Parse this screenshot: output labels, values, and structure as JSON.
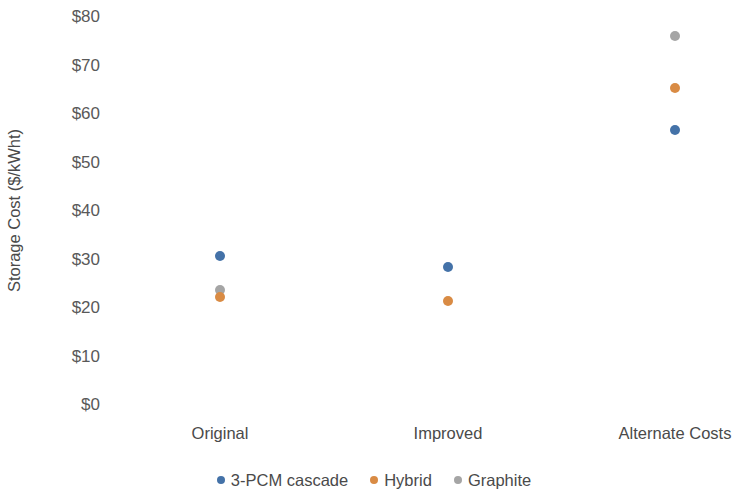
{
  "chart_data": {
    "type": "scatter",
    "title": "",
    "xlabel": "",
    "ylabel": "Storage Cost ($/kWht)",
    "categories": [
      "Original",
      "Improved",
      "Alternate Costs"
    ],
    "ylim": [
      0,
      80
    ],
    "ytick_values": [
      0,
      10,
      20,
      30,
      40,
      50,
      60,
      70,
      80
    ],
    "ytick_labels": [
      "$0",
      "$10",
      "$20",
      "$30",
      "$40",
      "$50",
      "$60",
      "$70",
      "$80"
    ],
    "grid": false,
    "legend_position": "bottom",
    "series": [
      {
        "name": "3-PCM cascade",
        "color": "#4472a8",
        "values": [
          30.8,
          28.5,
          56.6
        ]
      },
      {
        "name": "Hybrid",
        "color": "#d98b44",
        "values": [
          22.3,
          21.4,
          65.4
        ]
      },
      {
        "name": "Graphite",
        "color": "#a5a5a5",
        "values": [
          23.7,
          null,
          76.0
        ]
      }
    ]
  }
}
